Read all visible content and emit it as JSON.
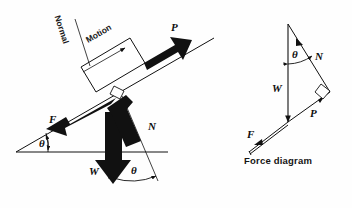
{
  "figure": {
    "background_color": "#fefefe",
    "ink_color": "#111111",
    "caption": "Force diagram"
  },
  "incline_diagram": {
    "name": "block-on-inclined-plane",
    "labels": {
      "normal": "Normal",
      "motion": "Motion",
      "applied_force": "P",
      "friction": "F",
      "normal_force": "N",
      "weight": "W",
      "angle_base": "θ",
      "angle_weight_normal": "θ"
    },
    "elements": {
      "block": "white-rectangle-block",
      "incline_surface": "inclined-line",
      "ground": "horizontal-ground-line",
      "right_angle_marker": "right-angle-square"
    }
  },
  "force_diagram": {
    "name": "force-triangle",
    "caption": "Force diagram",
    "labels": {
      "normal_force": "N",
      "weight": "W",
      "applied_force": "P",
      "friction": "F",
      "angle": "θ"
    },
    "elements": {
      "right_angle_marker": "right-angle-square"
    }
  }
}
